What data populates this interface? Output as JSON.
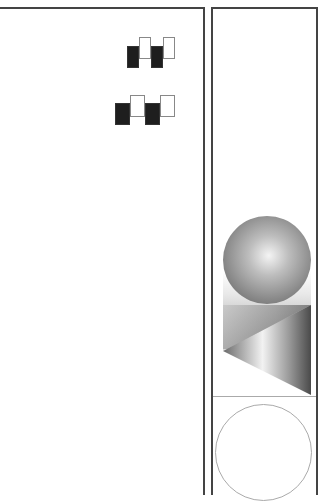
{
  "figure": {
    "left_panel": {
      "label": "",
      "block_rows": [
        {
          "row": 1,
          "pattern": [
            "dark",
            "light",
            "dark",
            "light"
          ]
        },
        {
          "row": 2,
          "pattern": [
            "dark",
            "light",
            "dark",
            "light"
          ]
        }
      ]
    },
    "right_panel": {
      "label": "",
      "shapes": [
        "shaded-sphere",
        "shaded-prism",
        "outline-circle"
      ]
    },
    "colors": {
      "border": "#444444",
      "dark_block": "#1e1e1e",
      "light_block_border": "#888888",
      "divider": "#aaaaaa"
    }
  }
}
